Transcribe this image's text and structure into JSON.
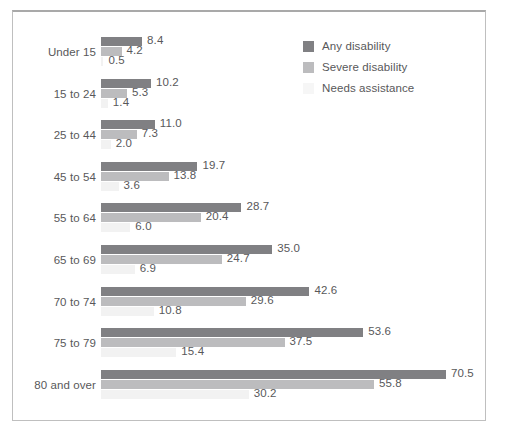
{
  "chart_data": {
    "type": "bar",
    "orientation": "horizontal",
    "title": "",
    "subtitle": "",
    "xlabel": "",
    "ylabel": "",
    "grid": false,
    "axis_visible": false,
    "xlim": [
      0,
      70.5
    ],
    "legend_position": "top-right",
    "categories": [
      "Under 15",
      "15 to 24",
      "25 to 44",
      "45 to 54",
      "55 to 64",
      "65 to 69",
      "70 to 74",
      "75 to 79",
      "80 and over"
    ],
    "series": [
      {
        "name": "Any disability",
        "color": "#808083",
        "values": [
          8.4,
          10.2,
          11.0,
          19.7,
          28.7,
          35.0,
          42.6,
          53.6,
          70.5
        ],
        "labels": [
          "8.4",
          "10.2",
          "11.0",
          "19.7",
          "28.7",
          "35.0",
          "42.6",
          "53.6",
          "70.5"
        ]
      },
      {
        "name": "Severe disability",
        "color": "#bcbcbe",
        "values": [
          4.2,
          5.3,
          7.3,
          13.8,
          20.4,
          24.7,
          29.6,
          37.5,
          55.8
        ],
        "labels": [
          "4.2",
          "5.3",
          "7.3",
          "13.8",
          "20.4",
          "24.7",
          "29.6",
          "37.5",
          "55.8"
        ]
      },
      {
        "name": "Needs assistance",
        "color": "#f2f2f2",
        "values": [
          0.5,
          1.4,
          2.0,
          3.6,
          6.0,
          6.9,
          10.8,
          15.4,
          30.2
        ],
        "labels": [
          "0.5",
          "1.4",
          "2.0",
          "3.6",
          "6.0",
          "6.9",
          "10.8",
          "15.4",
          "30.2"
        ]
      }
    ]
  },
  "legend": {
    "items": [
      {
        "label": "Any disability",
        "color": "#808083"
      },
      {
        "label": "Severe disability",
        "color": "#bcbcbe"
      },
      {
        "label": "Needs assistance",
        "color": "#f6f6f6"
      }
    ]
  },
  "colors": {
    "text": "#58585a",
    "frame": "#bfbfbf",
    "background": "#ffffff"
  }
}
